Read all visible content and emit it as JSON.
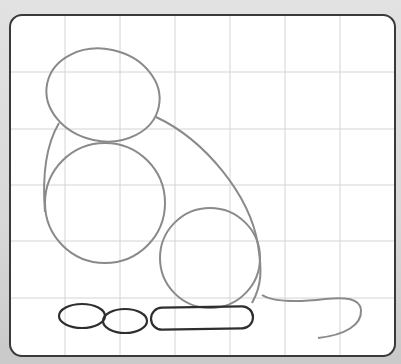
{
  "figure": {
    "colors": {
      "background": "#d6d6d6",
      "paper": "#ffffff",
      "frame": "#3a3a3a",
      "grid": "#d4d4d4",
      "construction_stroke": "#8a8a8a",
      "feet_stroke": "#2e2e2e"
    },
    "frame": {
      "x": 10,
      "y": 15,
      "width": 385,
      "height": 341,
      "radius": 12
    },
    "grid": {
      "vertical_lines_x": [
        65,
        120,
        175,
        230,
        285,
        340
      ],
      "horizontal_lines_y": [
        72,
        129,
        185,
        241,
        298
      ]
    },
    "shapes": [
      {
        "name": "head",
        "type": "ellipse",
        "cx": 103,
        "cy": 95,
        "rx": 57,
        "ry": 46,
        "rotate": 12
      },
      {
        "name": "chest",
        "type": "circle",
        "cx": 105,
        "cy": 203,
        "r": 60
      },
      {
        "name": "haunch",
        "type": "circle",
        "cx": 210,
        "cy": 258,
        "r": 50
      },
      {
        "name": "body-outline",
        "type": "path"
      },
      {
        "name": "tail",
        "type": "path"
      },
      {
        "name": "front-foot-left",
        "type": "ellipse",
        "cx": 82,
        "cy": 316,
        "rx": 23,
        "ry": 12
      },
      {
        "name": "front-foot-right",
        "type": "ellipse",
        "cx": 125,
        "cy": 321,
        "rx": 22,
        "ry": 12
      },
      {
        "name": "hind-foot",
        "type": "rounded-rect",
        "x": 151,
        "y": 306,
        "width": 102,
        "height": 23
      }
    ]
  }
}
